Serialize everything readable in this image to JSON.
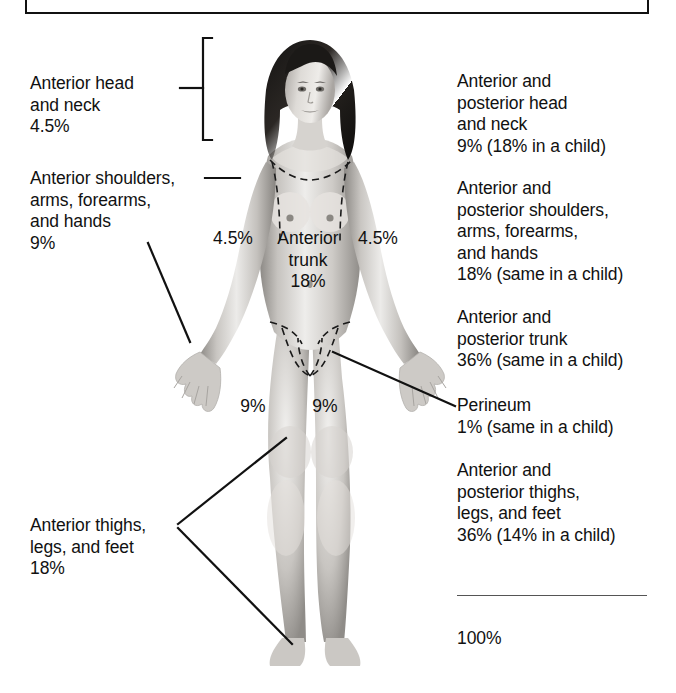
{
  "figure": {
    "total_label": "100%"
  },
  "left_labels": [
    {
      "name": "anterior-head-and-neck",
      "text": "Anterior head\nand neck\n4.5%"
    },
    {
      "name": "anterior-shoulders-arms-forearms-hands",
      "text": "Anterior shoulders,\narms, forearms,\nand hands\n9%"
    },
    {
      "name": "anterior-thighs-legs-feet",
      "text": "Anterior thighs,\nlegs, and feet\n18%"
    }
  ],
  "right_labels": [
    {
      "name": "anterior-posterior-head-and-neck",
      "text": "Anterior and\nposterior head\nand neck\n9% (18% in a child)"
    },
    {
      "name": "anterior-posterior-shoulders-arms-forearms-hands",
      "text": "Anterior and\nposterior shoulders,\narms, forearms,\nand hands\n18% (same in a child)"
    },
    {
      "name": "anterior-posterior-trunk",
      "text": "Anterior and\nposterior trunk\n36% (same in a child)"
    },
    {
      "name": "perineum",
      "text": "Perineum\n1% (same in a child)"
    },
    {
      "name": "anterior-posterior-thighs-legs-feet",
      "text": "Anterior and\nposterior thighs,\nlegs, and feet\n36% (14% in a child)"
    }
  ],
  "body_labels": {
    "left_arm_pct": "4.5%",
    "right_arm_pct": "4.5%",
    "trunk": "Anterior\ntrunk\n18%",
    "left_thigh_pct": "9%",
    "right_thigh_pct": "9%"
  },
  "colors": {
    "ink": "#111111",
    "rule": "#555555",
    "skin_light": "#e8e6e3",
    "skin_mid": "#b9b6b2",
    "skin_dark": "#8c8984",
    "hair": "#191716",
    "background": "#ffffff"
  }
}
